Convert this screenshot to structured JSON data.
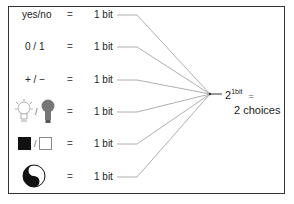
{
  "rows": [
    {
      "label": "yes/no",
      "equals": "=",
      "value": "1 bit"
    },
    {
      "label": "0 / 1",
      "equals": "=",
      "value": "1 bit"
    },
    {
      "label": "+ / −",
      "equals": "=",
      "value": "1 bit"
    },
    {
      "label": "lightbulb-off / lightbulb-on",
      "equals": "=",
      "value": "1 bit",
      "separator": "/"
    },
    {
      "label": "black-square / white-square",
      "equals": "=",
      "value": "1 bit",
      "separator": "/"
    },
    {
      "label": "yin-yang",
      "equals": "=",
      "value": "1 bit"
    }
  ],
  "result": {
    "base": "2",
    "exponent": "1bit",
    "equals": "=",
    "choices": "2 choices"
  },
  "colors": {
    "line": "#999999",
    "border": "#333333",
    "bulb_dark": "#777777"
  }
}
